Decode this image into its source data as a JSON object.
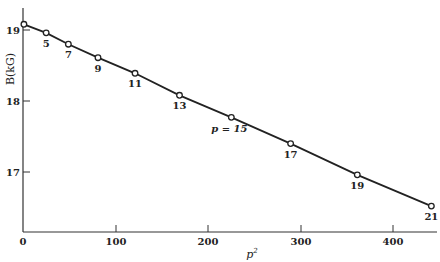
{
  "chart_data": {
    "type": "line",
    "title": "",
    "xlabel": "p²",
    "ylabel": "B(kG)",
    "xlim": [
      0,
      440
    ],
    "ylim": [
      16.15,
      19.25
    ],
    "x_ticks": [
      0,
      100,
      200,
      300,
      400
    ],
    "y_ticks": [
      17,
      18,
      19
    ],
    "grid": false,
    "legend": null,
    "markers": "open-circle",
    "series": [
      {
        "name": "B vs p²",
        "points": [
          {
            "p": 1,
            "p2": 1,
            "B": 19.08,
            "label": ""
          },
          {
            "p": 5,
            "p2": 25,
            "B": 18.96,
            "label": "5"
          },
          {
            "p": 7,
            "p2": 49,
            "B": 18.8,
            "label": "7"
          },
          {
            "p": 9,
            "p2": 81,
            "B": 18.61,
            "label": "9"
          },
          {
            "p": 11,
            "p2": 121,
            "B": 18.39,
            "label": "11"
          },
          {
            "p": 13,
            "p2": 169,
            "B": 18.08,
            "label": "13"
          },
          {
            "p": 15,
            "p2": 225,
            "B": 17.77,
            "label": "p = 15"
          },
          {
            "p": 17,
            "p2": 289,
            "B": 17.4,
            "label": "17"
          },
          {
            "p": 19,
            "p2": 361,
            "B": 16.96,
            "label": "19"
          },
          {
            "p": 21,
            "p2": 441,
            "B": 16.52,
            "label": "21"
          }
        ]
      }
    ],
    "annotations": [
      "p = 15"
    ]
  },
  "labels": {
    "ylabel": "B(kG)",
    "xlabel_base": "p",
    "xlabel_sup": "2",
    "xticks": [
      "0",
      "100",
      "200",
      "300",
      "400"
    ],
    "yticks": [
      "17",
      "18",
      "19"
    ]
  }
}
